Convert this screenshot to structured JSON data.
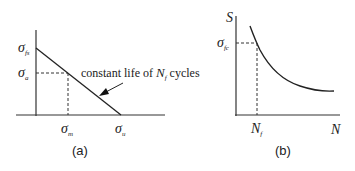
{
  "panel_a": {
    "caption": "(a)",
    "y_label_top_symbol": "σ",
    "y_label_top_sub": "fs",
    "y_label_mid_symbol": "σ",
    "y_label_mid_sub": "a",
    "x_label_mid_symbol": "σ",
    "x_label_mid_sub": "m",
    "x_label_end_symbol": "σ",
    "x_label_end_sub": "u",
    "annotation_prefix": "constant life of ",
    "annotation_var": "N",
    "annotation_sub": "f",
    "annotation_suffix": " cycles"
  },
  "panel_b": {
    "caption": "(b)",
    "y_axis_label": "S",
    "x_axis_label": "N",
    "y_marker_symbol": "σ",
    "y_marker_sub": "fc",
    "x_marker_var": "N",
    "x_marker_sub": "f"
  },
  "colors": {
    "line": "#222222",
    "text": "#222222"
  }
}
